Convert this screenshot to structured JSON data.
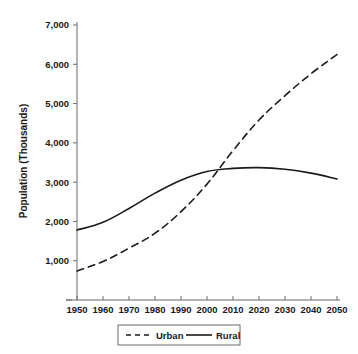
{
  "chart_data": {
    "type": "line",
    "title": "",
    "xlabel": "",
    "ylabel": "Population (Thousands)",
    "xlim": [
      1950,
      2050
    ],
    "ylim": [
      0,
      7000
    ],
    "grid": false,
    "legend_position": "bottom-center",
    "x": [
      1950,
      1960,
      1970,
      1980,
      1990,
      2000,
      2010,
      2020,
      2030,
      2040,
      2050
    ],
    "x_ticks": [
      "1950",
      "1960",
      "1970",
      "1980",
      "1990",
      "2000",
      "2010",
      "2020",
      "2030",
      "2040",
      "2050"
    ],
    "y_ticks": [
      "1,000",
      "2,000",
      "3,000",
      "4,000",
      "5,000",
      "6,000",
      "7,000"
    ],
    "y_tick_values": [
      1000,
      2000,
      3000,
      4000,
      5000,
      6000,
      7000
    ],
    "series": [
      {
        "name": "Urban",
        "style": "dashed",
        "color": "#1a1a1a",
        "values": [
          740,
          980,
          1320,
          1700,
          2250,
          2950,
          3800,
          4580,
          5200,
          5760,
          6250
        ]
      },
      {
        "name": "Rural",
        "style": "solid",
        "color": "#1a1a1a",
        "values": [
          1780,
          1980,
          2330,
          2720,
          3050,
          3270,
          3350,
          3370,
          3330,
          3230,
          3080
        ]
      }
    ],
    "legend": [
      {
        "label": "Urban",
        "style": "dashed"
      },
      {
        "label": "Rural",
        "style": "solid"
      }
    ]
  }
}
